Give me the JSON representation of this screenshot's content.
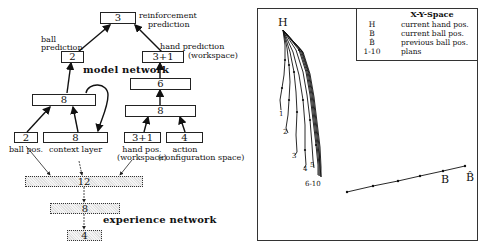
{
  "model_network": {
    "title": "model network",
    "nodes": {
      "reinforcement": {
        "units": "3",
        "label_line1": "reinforcement",
        "label_line2": "prediction"
      },
      "ball_prediction": {
        "units": "2",
        "label_line1": "ball",
        "label_line2": "prediction"
      },
      "hand_prediction": {
        "units": "3+1",
        "label_line1": "hand prediction",
        "label_line2": "(workspace)"
      },
      "hidden_6": {
        "units": "6"
      },
      "hidden_left_8": {
        "units": "8"
      },
      "hidden_right_8": {
        "units": "8"
      },
      "ball_pos": {
        "units": "2",
        "label_line1": "ball pos."
      },
      "context_layer": {
        "units": "8",
        "label_line1": "context layer"
      },
      "hand_pos": {
        "units": "3+1",
        "label_line1": "hand pos.",
        "label_line2": "(workspace)"
      },
      "action": {
        "units": "4",
        "label_line1": "action",
        "label_line2": "(configuration space)"
      }
    }
  },
  "experience_network": {
    "title": "experience network",
    "layers": [
      "12",
      "8",
      "4"
    ]
  },
  "plot": {
    "legend": {
      "title": "X-Y-Space",
      "rows": [
        {
          "symbol": "H",
          "description": "current hand pos."
        },
        {
          "symbol": "B",
          "description": "current ball pos."
        },
        {
          "symbol": "B̂",
          "description": "previous ball pos."
        },
        {
          "symbol": "1-10",
          "description": "plans"
        }
      ]
    },
    "labels": {
      "hand": "H",
      "ball": "B",
      "prev_ball": "B̂",
      "plan_1": "1",
      "plan_2": "2",
      "plan_3": "3",
      "plan_4": "4",
      "plan_5": "5",
      "plan_6_10": "6-10"
    }
  }
}
